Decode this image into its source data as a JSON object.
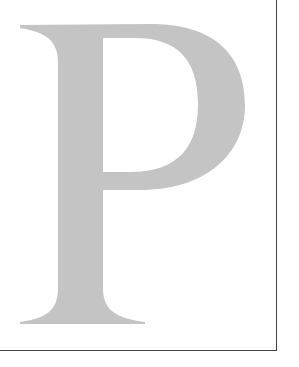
{
  "figure": {
    "letter": "P",
    "letter_color": "#c4c4c4",
    "border_color": "#444444",
    "background": "#ffffff"
  }
}
